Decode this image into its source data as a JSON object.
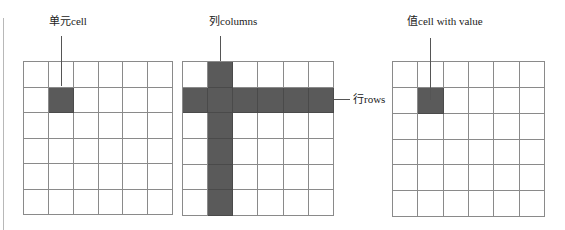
{
  "diagram": {
    "title": "",
    "shade_color": "#5a5a5a",
    "grid_line_color": "#8a8a8a",
    "panels": [
      {
        "id": "cell",
        "label": "单元cell",
        "rows": 6,
        "cols": 6,
        "highlighted_cells": [
          [
            1,
            1
          ]
        ],
        "highlighted_rows": [],
        "highlighted_cols": []
      },
      {
        "id": "rows-columns",
        "label": "列columns",
        "side_label": "行rows",
        "rows": 6,
        "cols": 6,
        "highlighted_cells": [],
        "highlighted_rows": [
          1
        ],
        "highlighted_cols": [
          1
        ]
      },
      {
        "id": "cell-with-value",
        "label": "值cell with value",
        "rows": 6,
        "cols": 6,
        "highlighted_cells": [
          [
            1,
            1
          ]
        ],
        "highlighted_rows": [],
        "highlighted_cols": []
      }
    ]
  }
}
